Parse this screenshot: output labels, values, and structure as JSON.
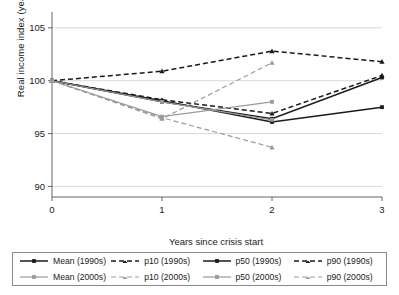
{
  "chart_data": {
    "type": "line",
    "title": "",
    "xlabel": "Years since crisis start",
    "ylabel": "Real income index (year 0 = 100)",
    "x": [
      0,
      1,
      2,
      3
    ],
    "xticklabels": [
      "0",
      "1",
      "2",
      "3"
    ],
    "yticklabels": [
      "90",
      "95",
      "100",
      "105"
    ],
    "yticks": [
      90,
      95,
      100,
      105
    ],
    "xlim": [
      0,
      3
    ],
    "ylim": [
      89,
      106.5
    ],
    "grid": "horizontal",
    "legend_position": "below-axes",
    "colors": {
      "decade_1990s": "#1a1a1a",
      "decade_2000s": "#9a9a9a",
      "grid": "#cfcfcf",
      "axis": "#555555"
    },
    "series": [
      {
        "name": "Mean (1990s)",
        "decade": "1990s",
        "style": "solid",
        "color": "#1a1a1a",
        "marker": "square",
        "x": [
          0,
          1,
          2,
          3
        ],
        "values": [
          100,
          98.0,
          96.4,
          100.3
        ]
      },
      {
        "name": "p10 (1990s)",
        "decade": "1990s",
        "style": "dashed",
        "color": "#1a1a1a",
        "marker": "triangle",
        "x": [
          0,
          1,
          2,
          3
        ],
        "values": [
          100,
          98.2,
          96.9,
          100.5
        ]
      },
      {
        "name": "p50 (1990s)",
        "decade": "1990s",
        "style": "solid",
        "color": "#1a1a1a",
        "marker": "square",
        "x": [
          0,
          1,
          2,
          3
        ],
        "values": [
          100,
          98.1,
          96.1,
          97.5
        ]
      },
      {
        "name": "p90 (1990s)",
        "decade": "1990s",
        "style": "dashed",
        "color": "#1a1a1a",
        "marker": "triangle",
        "x": [
          0,
          1,
          2,
          3
        ],
        "values": [
          100,
          100.9,
          102.8,
          101.8
        ]
      },
      {
        "name": "Mean (2000s)",
        "decade": "2000s",
        "style": "solid",
        "color": "#9a9a9a",
        "marker": "square",
        "x": [
          0,
          1,
          2
        ],
        "values": [
          100,
          98.0,
          96.3
        ]
      },
      {
        "name": "p10 (2000s)",
        "decade": "2000s",
        "style": "dashed",
        "color": "#9a9a9a",
        "marker": "triangle",
        "x": [
          0,
          1,
          2
        ],
        "values": [
          100,
          96.5,
          93.7
        ]
      },
      {
        "name": "p50 (2000s)",
        "decade": "2000s",
        "style": "solid",
        "color": "#9a9a9a",
        "marker": "square",
        "x": [
          0,
          1,
          2
        ],
        "values": [
          100,
          96.6,
          98.0
        ]
      },
      {
        "name": "p90 (2000s)",
        "decade": "2000s",
        "style": "dashed",
        "color": "#9a9a9a",
        "marker": "triangle",
        "x": [
          0,
          1,
          2
        ],
        "values": [
          100,
          96.4,
          101.7
        ]
      }
    ]
  },
  "legend": {
    "rows": [
      [
        {
          "label": "Mean (1990s)",
          "style": "solid",
          "color": "#1a1a1a",
          "marker": "square"
        },
        {
          "label": "p10 (1990s)",
          "style": "dashed",
          "color": "#1a1a1a",
          "marker": "triangle"
        },
        {
          "label": "p50 (1990s)",
          "style": "solid",
          "color": "#1a1a1a",
          "marker": "square"
        },
        {
          "label": "p90 (1990s)",
          "style": "dashed",
          "color": "#1a1a1a",
          "marker": "triangle"
        }
      ],
      [
        {
          "label": "Mean (2000s)",
          "style": "solid",
          "color": "#9a9a9a",
          "marker": "square"
        },
        {
          "label": "p10 (2000s)",
          "style": "dashed",
          "color": "#9a9a9a",
          "marker": "triangle"
        },
        {
          "label": "p50 (2000s)",
          "style": "solid",
          "color": "#9a9a9a",
          "marker": "square"
        },
        {
          "label": "p90 (2000s)",
          "style": "dashed",
          "color": "#9a9a9a",
          "marker": "triangle"
        }
      ]
    ]
  }
}
